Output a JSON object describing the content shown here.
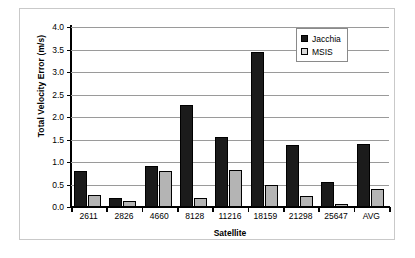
{
  "chart_data": {
    "type": "bar",
    "title": "",
    "xlabel": "Satellite",
    "ylabel": "Total Velocity Error (m/s)",
    "categories": [
      "2611",
      "2826",
      "4660",
      "8128",
      "11216",
      "18159",
      "21298",
      "25647",
      "AVG"
    ],
    "series": [
      {
        "name": "Jacchia",
        "color": "#1b1b1b",
        "values": [
          0.8,
          0.2,
          0.92,
          2.27,
          1.56,
          3.45,
          1.37,
          0.56,
          1.41
        ]
      },
      {
        "name": "MSIS",
        "color": "#b4b4b4",
        "values": [
          0.26,
          0.13,
          0.81,
          0.21,
          0.83,
          0.49,
          0.24,
          0.07,
          0.39
        ]
      }
    ],
    "ylim": [
      0.0,
      4.0
    ],
    "ytick_step": 0.5,
    "yticks": [
      "4.0",
      "3.5",
      "3.0",
      "2.5",
      "2.0",
      "1.5",
      "1.0",
      "0.5",
      "0.0"
    ],
    "ytick_values": [
      4.0,
      3.5,
      3.0,
      2.5,
      2.0,
      1.5,
      1.0,
      0.5,
      0.0
    ],
    "grid": true,
    "grid_axis": "y",
    "legend_position": "top-right",
    "legend": [
      "Jacchia",
      "MSIS"
    ]
  },
  "legend": {
    "entries": [
      {
        "label": "Jacchia",
        "swatch": "legend-swatch-jacchia"
      },
      {
        "label": "MSIS",
        "swatch": "legend-swatch-msis"
      }
    ]
  },
  "axes": {
    "y_title": "Total Velocity Error (m/s)",
    "x_title": "Satellite"
  }
}
